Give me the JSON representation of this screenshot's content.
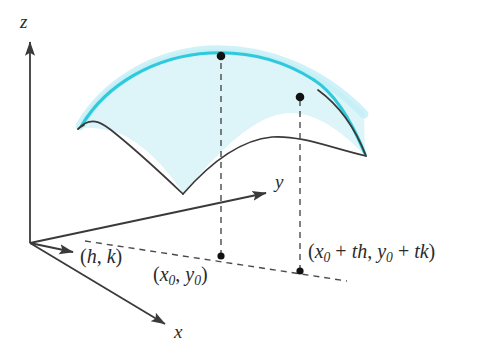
{
  "figure": {
    "background_color": "#ffffff"
  },
  "axes": {
    "z": {
      "label": "z",
      "arrow": "up"
    },
    "y": {
      "label": "y",
      "arrow": "up-right"
    },
    "x": {
      "label": "x",
      "arrow": "down-right"
    },
    "origin_label": "",
    "axis_color": "#3a3a3a"
  },
  "vector": {
    "label_open": "(",
    "label_h": "h",
    "label_comma": ", ",
    "label_k": "k",
    "label_close": ")",
    "full_label": "(h, k)"
  },
  "points": [
    {
      "name": "base-point-0",
      "label_parts": {
        "open": "(",
        "x": "x",
        "xsub": "0",
        "comma": ", ",
        "y": "y",
        "ysub": "0",
        "close": ")"
      },
      "full_label": "(x0, y0)",
      "on_surface": true
    },
    {
      "name": "base-point-1",
      "label_parts": {
        "open": "(",
        "x": "x",
        "xsub": "0",
        "plus1": " + ",
        "th": "th",
        "comma": ", ",
        "y": "y",
        "ysub": "0",
        "plus2": " + ",
        "tk": "tk",
        "close": ")"
      },
      "full_label": "(x0 + th, y0 + tk)",
      "on_surface": true
    }
  ],
  "surface": {
    "fill_color": "#ddf4f8",
    "highlight_curve_color": "#2fc9dd",
    "outline_color": "#3a3a3a",
    "description": "saddle-like surface patch with a highlighted cyan trace curve"
  },
  "dashed_lines": {
    "color": "#4a4a4a",
    "style": "dashed",
    "count": 4
  }
}
